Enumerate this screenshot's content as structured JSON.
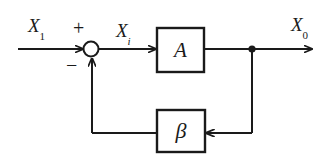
{
  "figure": {
    "type": "block-diagram",
    "name": "negative-feedback-amplifier",
    "background_color": "#ffffff",
    "line_color": "#1a1a1a"
  },
  "labels": {
    "input_signal": "X",
    "input_signal_subscript": "1",
    "error_signal": "X",
    "error_signal_subscript": "i",
    "output_signal": "X",
    "output_signal_subscript": "0",
    "plus_sign": "+",
    "minus_sign": "−"
  },
  "blocks": [
    {
      "id": "forward-gain",
      "label": "A",
      "shape": "rectangle"
    },
    {
      "id": "feedback-gain",
      "label": "β",
      "shape": "rectangle"
    }
  ],
  "nodes": [
    {
      "id": "summing-junction",
      "shape": "circle",
      "inputs": [
        "input_signal",
        "feedback"
      ],
      "signs": [
        "+",
        "−"
      ]
    },
    {
      "id": "output-tap",
      "shape": "dot"
    }
  ],
  "connections": [
    {
      "id": "input-to-sum",
      "from": "input",
      "to": "summing-junction",
      "arrow": true
    },
    {
      "id": "sum-to-A",
      "from": "summing-junction",
      "to": "forward-gain",
      "arrow": true
    },
    {
      "id": "A-to-output",
      "from": "forward-gain",
      "to": "output",
      "arrow": true
    },
    {
      "id": "tap-to-beta",
      "from": "output-tap",
      "to": "feedback-gain",
      "arrow": true
    },
    {
      "id": "beta-to-sum",
      "from": "feedback-gain",
      "to": "summing-junction",
      "arrow": true
    }
  ]
}
